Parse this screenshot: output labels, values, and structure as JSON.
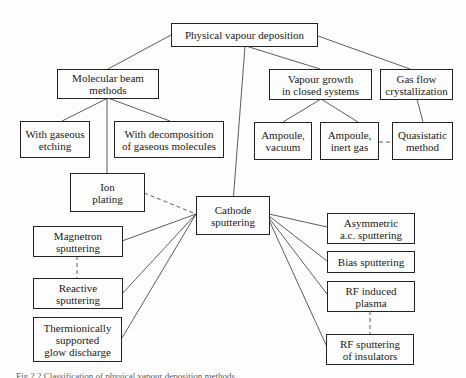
{
  "diagram": {
    "title": "Classification of physical vapour deposition methods",
    "nodes": {
      "pvd": "Physical vapour deposition",
      "mbe": "Molecular beam\nmethods",
      "vapour_closed": "Vapour growth\nin closed systems",
      "gas_flow": "Gas flow\ncrystallization",
      "gaseous_etching": "With gaseous\netching",
      "decomposition": "With decomposition\nof gaseous molecules",
      "ampoule_vacuum": "Ampoule,\nvacuum",
      "ampoule_inert": "Ampoule,\ninert gas",
      "quasistatic": "Quasistatic\nmethod",
      "ion_plating": "Ion\nplating",
      "cathode": "Cathode\nsputtering",
      "magnetron": "Magnetron\nsputtering",
      "reactive": "Reactive\nsputtering",
      "thermionic": "Thermionically\nsupported\nglow discharge",
      "asymmetric": "Asymmetric\na.c. sputtering",
      "bias": "Bias sputtering",
      "rf_plasma": "RF induced\nplasma",
      "rf_insulators": "RF sputtering\nof insulators"
    },
    "edges": [
      {
        "from": "pvd",
        "to": "mbe",
        "style": "solid"
      },
      {
        "from": "pvd",
        "to": "vapour_closed",
        "style": "solid"
      },
      {
        "from": "pvd",
        "to": "gas_flow",
        "style": "solid"
      },
      {
        "from": "pvd",
        "to": "cathode",
        "style": "solid"
      },
      {
        "from": "mbe",
        "to": "gaseous_etching",
        "style": "solid"
      },
      {
        "from": "mbe",
        "to": "decomposition",
        "style": "solid"
      },
      {
        "from": "mbe",
        "to": "ion_plating",
        "style": "solid"
      },
      {
        "from": "vapour_closed",
        "to": "ampoule_vacuum",
        "style": "solid"
      },
      {
        "from": "vapour_closed",
        "to": "ampoule_inert",
        "style": "solid"
      },
      {
        "from": "gas_flow",
        "to": "quasistatic",
        "style": "solid"
      },
      {
        "from": "ampoule_inert",
        "to": "quasistatic",
        "style": "dashed"
      },
      {
        "from": "ion_plating",
        "to": "cathode",
        "style": "dashed"
      },
      {
        "from": "cathode",
        "to": "magnetron",
        "style": "solid"
      },
      {
        "from": "cathode",
        "to": "reactive",
        "style": "solid"
      },
      {
        "from": "cathode",
        "to": "thermionic",
        "style": "solid"
      },
      {
        "from": "cathode",
        "to": "asymmetric",
        "style": "solid"
      },
      {
        "from": "cathode",
        "to": "bias",
        "style": "solid"
      },
      {
        "from": "cathode",
        "to": "rf_plasma",
        "style": "solid"
      },
      {
        "from": "cathode",
        "to": "rf_insulators",
        "style": "solid"
      },
      {
        "from": "magnetron",
        "to": "reactive",
        "style": "dashed"
      },
      {
        "from": "rf_plasma",
        "to": "rf_insulators",
        "style": "dashed"
      }
    ]
  },
  "caption": "Fig 2.2  Classification of physical vapour deposition methods"
}
